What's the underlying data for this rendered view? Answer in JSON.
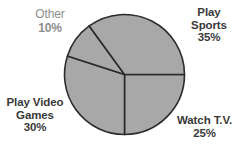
{
  "chart_data": {
    "type": "pie",
    "title": "",
    "subtitle": "",
    "xlabel": "",
    "ylabel": "",
    "legend_position": "none",
    "grid": false,
    "units": "percent",
    "start_angle_deg": 0,
    "direction": "clockwise",
    "categories": [
      "Play Sports",
      "Watch T.V.",
      "Play Video Games",
      "Other"
    ],
    "values": [
      35,
      25,
      30,
      10
    ],
    "slices": [
      {
        "label": "Play Sports",
        "label_lines": [
          "Play",
          "Sports"
        ],
        "value": 35,
        "value_text": "35%",
        "position": "top-right",
        "start_deg": 257,
        "end_deg": 360
      },
      {
        "label": "Watch T.V.",
        "label_lines": [
          "Watch T.V."
        ],
        "value": 25,
        "value_text": "25%",
        "position": "bottom-right",
        "start_deg": 0,
        "end_deg": 90
      },
      {
        "label": "Play Video Games",
        "label_lines": [
          "Play Video",
          "Games"
        ],
        "value": 30,
        "value_text": "30%",
        "position": "bottom-left",
        "start_deg": 90,
        "end_deg": 198
      },
      {
        "label": "Other",
        "label_lines": [
          "Other"
        ],
        "value": 10,
        "value_text": "10%",
        "position": "top-left",
        "start_deg": 198,
        "end_deg": 234
      }
    ],
    "colors": {
      "slice_fill": "#a8a8a8",
      "slice_outline": "#2b2b2b",
      "background": "#ffffff",
      "label_text": "#3a3a3a",
      "muted_label_text": "#8e8e8e"
    }
  }
}
